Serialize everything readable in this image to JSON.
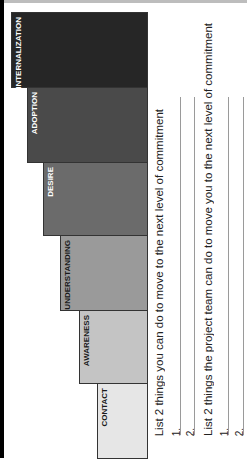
{
  "stages": [
    {
      "label": "INTERNALIZATION",
      "color": "#262626",
      "text_color": "#ffffff"
    },
    {
      "label": "ADOPTION",
      "color": "#4a4a4a",
      "text_color": "#ffffff"
    },
    {
      "label": "DESIRE",
      "color": "#6b6b6b",
      "text_color": "#ffffff"
    },
    {
      "label": "UNDERSTANDING",
      "color": "#9a9a9a",
      "text_color": "#1a1a1a"
    },
    {
      "label": "AWARENESS",
      "color": "#c4c4c4",
      "text_color": "#1a1a1a"
    },
    {
      "label": "CONTACT",
      "color": "#e6e6e6",
      "text_color": "#1a1a1a"
    }
  ],
  "prompts": [
    {
      "text": "List 2 things you can do to move to the next level of commitment",
      "items": [
        "1.",
        "2."
      ]
    },
    {
      "text": "List 2 things the project team can do to move you to the next level of commitment",
      "items": [
        "1.",
        "2."
      ]
    }
  ]
}
